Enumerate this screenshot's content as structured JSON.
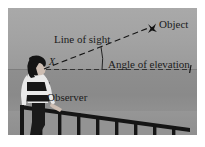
{
  "diagram": {
    "labels": {
      "object": "Object",
      "line_of_sight": "Line of sight",
      "angle_of_elevation": "Angle of elevation",
      "vertex": "X",
      "observer": "Observer"
    },
    "icons": {
      "object_marker": "bird-icon",
      "horizon_tick": "tick-mark-icon"
    },
    "colors": {
      "sky": "#a9a9a9",
      "sea": "#8c8c8c",
      "ground": "#949494",
      "line": "#1b1b1b",
      "text": "#1b1b1b",
      "shirt": "#e8e8e8",
      "stripe": "#171717",
      "hair": "#141414",
      "pants": "#1a1a1a",
      "railing": "#151515",
      "page_background": "#ffffff"
    },
    "geometry": {
      "vertex_point": [
        38,
        60
      ],
      "object_point": [
        146,
        20
      ],
      "horizontal_ray_end": [
        183,
        62
      ],
      "line_style": "dashed",
      "angle_arc_radius": 52
    }
  }
}
